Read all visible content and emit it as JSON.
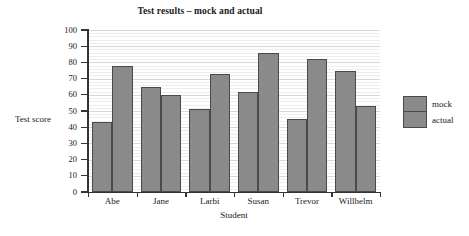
{
  "chart_data": {
    "type": "bar",
    "title": "Test results – mock and actual",
    "xlabel": "Student",
    "ylabel": "Test score",
    "categories": [
      "Abe",
      "Jane",
      "Larbi",
      "Susan",
      "Trevor",
      "Willhelm"
    ],
    "series": [
      {
        "name": "mock",
        "values": [
          43,
          65,
          51,
          62,
          45,
          75
        ],
        "color": "#8a8a8a"
      },
      {
        "name": "actual",
        "values": [
          78,
          60,
          73,
          86,
          82,
          53
        ],
        "color": "#8a8a8a"
      }
    ],
    "ylim": [
      0,
      100
    ],
    "yticks": [
      0,
      10,
      20,
      30,
      40,
      50,
      60,
      70,
      80,
      90,
      100
    ],
    "ytick_labels": [
      "0",
      "10",
      "20",
      "30",
      "40",
      "50",
      "60",
      "70",
      "80",
      "90",
      "100"
    ],
    "grid": true,
    "grid_orientation": "horizontal",
    "legend_position": "right",
    "bar_edge_color": "#4a4a4a",
    "background_color": "#ffffff",
    "axis_color": "#333333"
  }
}
